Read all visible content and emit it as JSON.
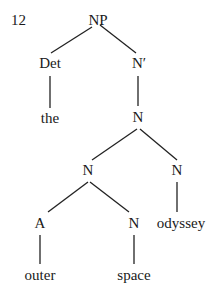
{
  "example_number": "12",
  "tree": {
    "nodes": [
      {
        "id": "np",
        "label": "NP",
        "x": 98,
        "y": 20
      },
      {
        "id": "det",
        "label": "Det",
        "x": 50,
        "y": 63
      },
      {
        "id": "nbar",
        "label": "N′",
        "x": 139,
        "y": 63
      },
      {
        "id": "the",
        "label": "the",
        "x": 50,
        "y": 118
      },
      {
        "id": "n1",
        "label": "N",
        "x": 138,
        "y": 117
      },
      {
        "id": "n2",
        "label": "N",
        "x": 88,
        "y": 170
      },
      {
        "id": "n3",
        "label": "N",
        "x": 177,
        "y": 170
      },
      {
        "id": "a",
        "label": "A",
        "x": 40,
        "y": 223
      },
      {
        "id": "n4",
        "label": "N",
        "x": 134,
        "y": 223
      },
      {
        "id": "odyssey",
        "label": "odyssey",
        "x": 181,
        "y": 223
      },
      {
        "id": "outer",
        "label": "outer",
        "x": 40,
        "y": 275
      },
      {
        "id": "space",
        "label": "space",
        "x": 134,
        "y": 275
      }
    ],
    "edges": [
      {
        "x1": 92,
        "y1": 27,
        "x2": 51,
        "y2": 53
      },
      {
        "x1": 100,
        "y1": 25,
        "x2": 136,
        "y2": 53
      },
      {
        "x1": 50,
        "y1": 76,
        "x2": 50,
        "y2": 108
      },
      {
        "x1": 138,
        "y1": 76,
        "x2": 138,
        "y2": 106
      },
      {
        "x1": 137,
        "y1": 129,
        "x2": 92,
        "y2": 160
      },
      {
        "x1": 140,
        "y1": 129,
        "x2": 177,
        "y2": 160
      },
      {
        "x1": 88,
        "y1": 182,
        "x2": 48,
        "y2": 212
      },
      {
        "x1": 90,
        "y1": 182,
        "x2": 129,
        "y2": 212
      },
      {
        "x1": 177,
        "y1": 182,
        "x2": 177,
        "y2": 212
      },
      {
        "x1": 40,
        "y1": 235,
        "x2": 40,
        "y2": 264
      },
      {
        "x1": 134,
        "y1": 235,
        "x2": 134,
        "y2": 264
      }
    ]
  }
}
